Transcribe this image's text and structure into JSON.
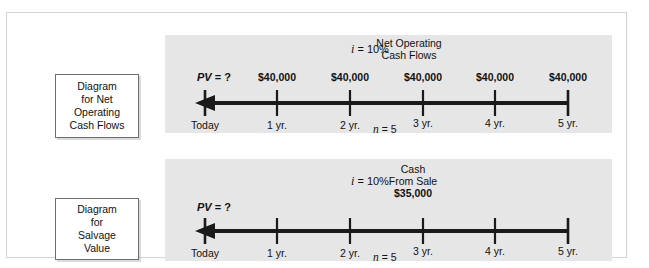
{
  "scan_artifact": "",
  "figure": {
    "panel_bg": "#e6e6e6",
    "frame_border": "#d2d4d8",
    "axis_color": "#1a1a1a"
  },
  "diagrams": [
    {
      "id": "net-operating-cash-flows",
      "caption_lines": [
        "Diagram",
        "for Net",
        "Operating",
        "Cash Flows"
      ],
      "rate_symbol": "i",
      "rate_text": "= 10%",
      "periods_symbol": "n",
      "periods_text": "= 5",
      "pv_symbol": "PV",
      "pv_text": "= ?",
      "corner_note_lines": [
        "Net Operating",
        "Cash Flows"
      ],
      "tick_labels": [
        "Today",
        "1 yr.",
        "2 yr.",
        "3 yr.",
        "4 yr.",
        "5 yr."
      ],
      "cash_flows": [
        "$40,000",
        "$40,000",
        "$40,000",
        "$40,000",
        "$40,000"
      ],
      "arrow_direction": "left"
    },
    {
      "id": "salvage-value",
      "caption_lines": [
        "Diagram",
        "for",
        "Salvage",
        "Value"
      ],
      "rate_symbol": "i",
      "rate_text": "= 10%",
      "periods_symbol": "n",
      "periods_text": "= 5",
      "pv_symbol": "PV",
      "pv_text": "= ?",
      "corner_note_lines": [
        "Cash",
        "From Sale",
        "$35,000"
      ],
      "tick_labels": [
        "Today",
        "1 yr.",
        "2 yr.",
        "3 yr.",
        "4 yr.",
        "5 yr."
      ],
      "cash_flows": [],
      "arrow_direction": "left"
    }
  ]
}
